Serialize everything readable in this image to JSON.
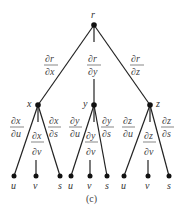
{
  "diagram": {
    "type": "tree",
    "root": {
      "label": "r"
    },
    "level1": [
      {
        "label": "x",
        "edge_num": "∂r",
        "edge_den": "∂x"
      },
      {
        "label": "y",
        "edge_num": "∂r",
        "edge_den": "∂y"
      },
      {
        "label": "z",
        "edge_num": "∂r",
        "edge_den": "∂z"
      }
    ],
    "level2": [
      {
        "parent": "x",
        "label": "u",
        "edge_num": "∂x",
        "edge_den": "∂u"
      },
      {
        "parent": "x",
        "label": "v",
        "edge_num": "∂x",
        "edge_den": "∂v"
      },
      {
        "parent": "x",
        "label": "s",
        "edge_num": "∂x",
        "edge_den": "∂s"
      },
      {
        "parent": "y",
        "label": "u",
        "edge_num": "∂y",
        "edge_den": "∂u"
      },
      {
        "parent": "y",
        "label": "v",
        "edge_num": "∂y",
        "edge_den": "∂v"
      },
      {
        "parent": "y",
        "label": "s",
        "edge_num": "∂y",
        "edge_den": "∂s"
      },
      {
        "parent": "z",
        "label": "u",
        "edge_num": "∂z",
        "edge_den": "∂u"
      },
      {
        "parent": "z",
        "label": "v",
        "edge_num": "∂z",
        "edge_den": "∂v"
      },
      {
        "parent": "z",
        "label": "s",
        "edge_num": "∂z",
        "edge_den": "∂s"
      }
    ],
    "caption": "(c)"
  }
}
